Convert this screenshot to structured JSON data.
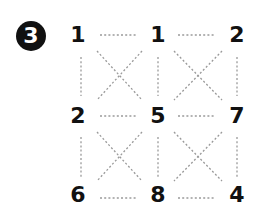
{
  "problem": {
    "badge_number": "3",
    "grid": {
      "rows": [
        [
          "1",
          "1",
          "2"
        ],
        [
          "2",
          "5",
          "7"
        ],
        [
          "6",
          "8",
          "4"
        ]
      ]
    },
    "line_color": "#9a9a9a",
    "text_color": "#111111"
  }
}
